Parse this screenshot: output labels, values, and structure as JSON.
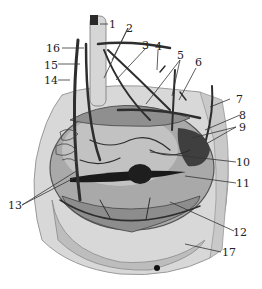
{
  "figure": {
    "labels": [
      {
        "id": "1",
        "text": "1"
      },
      {
        "id": "2",
        "text": "2"
      },
      {
        "id": "3",
        "text": "3"
      },
      {
        "id": "4",
        "text": "4"
      },
      {
        "id": "5",
        "text": "5"
      },
      {
        "id": "6",
        "text": "6"
      },
      {
        "id": "7",
        "text": "7"
      },
      {
        "id": "8",
        "text": "8"
      },
      {
        "id": "9",
        "text": "9"
      },
      {
        "id": "10",
        "text": "10"
      },
      {
        "id": "11",
        "text": "11"
      },
      {
        "id": "12",
        "text": "12"
      },
      {
        "id": "13",
        "text": "13"
      },
      {
        "id": "14",
        "text": "14"
      },
      {
        "id": "15",
        "text": "15"
      },
      {
        "id": "16",
        "text": "16"
      },
      {
        "id": "17",
        "text": "17"
      }
    ]
  }
}
